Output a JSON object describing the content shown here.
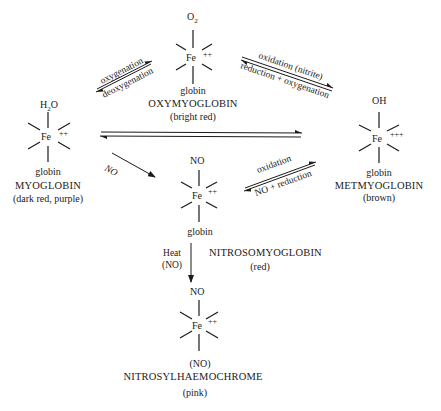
{
  "species": {
    "oxymyoglobin": {
      "ligand_top": "O",
      "ligand_top_sub": "2",
      "center": "Fe",
      "charge": "++",
      "ligand_bottom": "globin",
      "name": "OXYMYOGLOBIN",
      "color": "(bright red)"
    },
    "myoglobin": {
      "ligand_top": "H",
      "ligand_top_sub": "2",
      "ligand_top_rest": "O",
      "center": "Fe",
      "charge": "++",
      "ligand_bottom": "globin",
      "name": "MYOGLOBIN",
      "color": "(dark red, purple)"
    },
    "metmyoglobin": {
      "ligand_top": "OH",
      "center": "Fe",
      "charge": "+++",
      "ligand_bottom": "globin",
      "name": "METMYOGLOBIN",
      "color": "(brown)"
    },
    "nitrosomyoglobin": {
      "ligand_top": "NO",
      "center": "Fe",
      "charge": "++",
      "ligand_bottom": "globin",
      "name": "NITROSOMYOGLOBIN",
      "color": "(red)"
    },
    "nitrosylhaemochrome": {
      "ligand_top": "NO",
      "center": "Fe",
      "charge": "++",
      "ligand_bottom": "(NO)",
      "name": "NITROSYLHAEMOCHROME",
      "color": "(pink)"
    }
  },
  "reactions": {
    "myo_oxy": {
      "forward": "oxygenation",
      "reverse": "deoxygenation"
    },
    "oxy_met": {
      "forward": "oxidation (nitrite)",
      "reverse": "reduction + oxygenation"
    },
    "myo_met": {
      "forward": "",
      "reverse": ""
    },
    "myo_nitroso": {
      "label": "NO"
    },
    "met_nitroso": {
      "forward": "oxidation",
      "reverse": "NO + reduction"
    },
    "nitroso_haemochrome": {
      "label_line1": "Heat",
      "label_line2": "(NO)"
    }
  }
}
